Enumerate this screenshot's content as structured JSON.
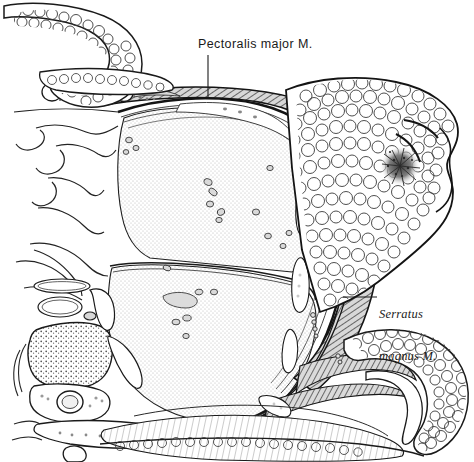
{
  "figure": {
    "kind": "anatomical-cross-section",
    "background_color": "#ffffff",
    "ink_color": "#1a1a1a"
  },
  "labels": [
    {
      "id": "pectoralis-major",
      "text": "Pectoralis major M.",
      "style": "upright",
      "x": 198,
      "y": 37,
      "leader": {
        "type": "vertical",
        "x": 208,
        "y1": 55,
        "y2": 99
      }
    },
    {
      "id": "serratus-magnus",
      "line1": "Serratus",
      "line2": "magnus M.",
      "style": "italic",
      "x": 379,
      "y": 279,
      "leader": {
        "type": "horizontal",
        "y": 297,
        "x1": 343,
        "x2": 377
      }
    }
  ],
  "structures": [
    {
      "name": "skin-fold-upper-left",
      "tissue": "subcutaneous-fat",
      "texture": "lobular"
    },
    {
      "name": "skin-fold-lower-right",
      "tissue": "subcutaneous-fat",
      "texture": "lobular"
    },
    {
      "name": "breast",
      "tissue": "adipose",
      "texture": "lobular"
    },
    {
      "name": "nipple-areola",
      "tissue": "nipple",
      "texture": "dense-stipple"
    },
    {
      "name": "pectoralis-major-muscle",
      "tissue": "skeletal-muscle",
      "texture": "hatch"
    },
    {
      "name": "serratus-magnus-muscle",
      "tissue": "skeletal-muscle",
      "texture": "hatch"
    },
    {
      "name": "lung-upper-lobe",
      "tissue": "lung",
      "texture": "fine-stipple"
    },
    {
      "name": "lung-lower-lobe",
      "tissue": "lung",
      "texture": "fine-stipple"
    },
    {
      "name": "oblique-fissure",
      "tissue": "pleura",
      "texture": "line"
    },
    {
      "name": "pleural-layers",
      "tissue": "pleura",
      "texture": "parallel-lines"
    },
    {
      "name": "ribs",
      "tissue": "bone",
      "texture": "outline"
    },
    {
      "name": "costal-cartilage",
      "tissue": "cartilage",
      "texture": "stipple"
    },
    {
      "name": "vertebral-body",
      "tissue": "cancellous-bone",
      "texture": "coarse-stipple"
    },
    {
      "name": "spinal-cord",
      "tissue": "nervous",
      "texture": "outline"
    },
    {
      "name": "spinous-process",
      "tissue": "bone",
      "texture": "outline"
    },
    {
      "name": "mediastinal-vessels",
      "tissue": "vessel",
      "texture": "outline"
    },
    {
      "name": "pulmonary-vessels",
      "tissue": "vessel",
      "texture": "small-ovals"
    }
  ],
  "palette": {
    "ink": "#1a1a1a",
    "line": "#222222",
    "muscle_hatch": "#4a4a4a",
    "muscle_fill": "#b9b9b9",
    "lung_stipple": "#b4b4b4",
    "bone_stipple": "#5a5a5a",
    "fat_outline": "#2b2b2b",
    "paper": "#ffffff"
  }
}
